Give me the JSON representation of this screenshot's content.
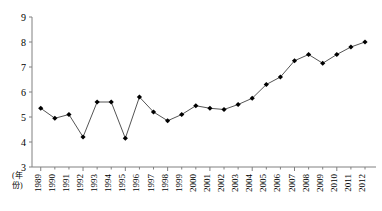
{
  "chart_data": {
    "type": "line",
    "title": "",
    "subtitle": "",
    "xlabel": "(年份)",
    "ylabel": "",
    "categories": [
      "1989",
      "1990",
      "1991",
      "1992",
      "1993",
      "1994",
      "1995",
      "1996",
      "1997",
      "1998",
      "1999",
      "2000",
      "2001",
      "2002",
      "2003",
      "2004",
      "2005",
      "2006",
      "2007",
      "2008",
      "2009",
      "2010",
      "2011",
      "2012"
    ],
    "values": [
      5.35,
      4.95,
      5.1,
      4.2,
      5.6,
      5.6,
      4.15,
      5.8,
      5.2,
      4.85,
      5.1,
      5.45,
      5.35,
      5.3,
      5.5,
      5.75,
      6.3,
      6.6,
      7.25,
      7.5,
      7.15,
      7.5,
      7.8,
      8.0
    ],
    "ylim": [
      3,
      9
    ],
    "yticks": [
      3,
      4,
      5,
      6,
      7,
      8,
      9
    ],
    "ytick_labels": [
      "3",
      "4",
      "5",
      "6",
      "7",
      "8",
      "9"
    ],
    "grid": false,
    "legend": null,
    "legend_position": "none",
    "marker": "filled-diamond",
    "line_color": "#555555",
    "marker_color": "#000000",
    "axis_color": "#808080"
  },
  "axis": {
    "corner_label_line1": "(年",
    "corner_label_line2": "份)"
  }
}
